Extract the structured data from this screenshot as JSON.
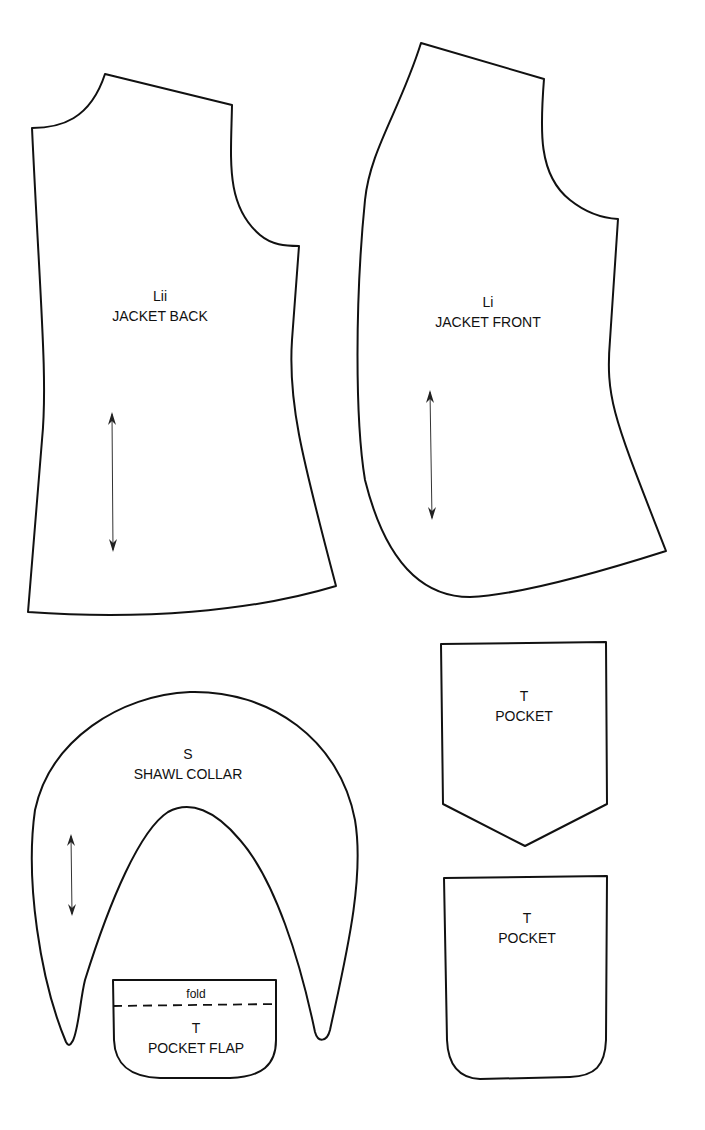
{
  "sheet": {
    "background": "#ffffff",
    "line_color": "#111111"
  },
  "pieces": {
    "jacket_back": {
      "code": "Lii",
      "name": "JACKET BACK",
      "grainline": true
    },
    "jacket_front": {
      "code": "Li",
      "name": "JACKET FRONT",
      "grainline": true
    },
    "shawl_collar": {
      "code": "S",
      "name": "SHAWL COLLAR",
      "grainline": true
    },
    "pocket_pointed": {
      "code": "T",
      "name": "POCKET"
    },
    "pocket_rounded": {
      "code": "T",
      "name": "POCKET"
    },
    "pocket_flap": {
      "code": "T",
      "name": "POCKET FLAP",
      "fold_label": "fold"
    }
  }
}
